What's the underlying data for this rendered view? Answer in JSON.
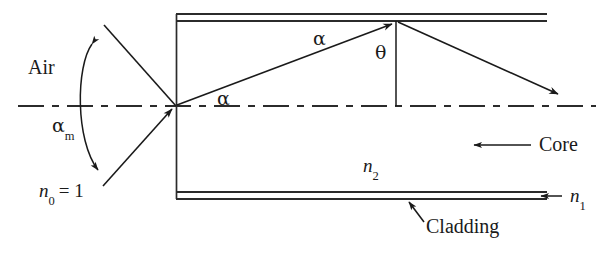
{
  "figure": {
    "type": "physics-ray-diagram"
  },
  "labels": {
    "air": "Air",
    "alpha_max": "α",
    "alpha_max_sub": "m",
    "n0": "n",
    "n0_sub": "0",
    "n0_value": "= 1",
    "alpha_core_entry": "α",
    "alpha_core_upper": "α",
    "theta": "θ",
    "n2": "n",
    "n2_sub": "2",
    "n1": "n",
    "n1_sub": "1",
    "core": "Core",
    "cladding": "Cladding"
  },
  "colors": {
    "ink": "#1a1a1a",
    "line": "#2b2b2b",
    "background": "#ffffff"
  },
  "geometry": {
    "fiber_left_x": 176,
    "fiber_top_outer_y": 14,
    "fiber_top_inner_y": 21,
    "fiber_bottom_inner_y": 192,
    "fiber_bottom_outer_y": 199,
    "fiber_right_x": 547,
    "axis_y": 106,
    "entry_point_x": 176,
    "entry_point_y": 106,
    "reflect_point_x": 396,
    "reflect_point_y": 21,
    "exit_arrow_x": 561,
    "exit_arrow_y": 96
  }
}
